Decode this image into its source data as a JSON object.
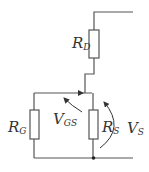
{
  "diagram": {
    "type": "circuit",
    "line_color": "#555555",
    "components": [
      {
        "id": "RD",
        "label_main": "R",
        "label_sub": "D",
        "kind": "resistor"
      },
      {
        "id": "RG",
        "label_main": "R",
        "label_sub": "G",
        "kind": "resistor"
      },
      {
        "id": "RS",
        "label_main": "R",
        "label_sub": "S",
        "kind": "resistor"
      }
    ],
    "voltages": [
      {
        "id": "VGS",
        "label_main": "V",
        "label_sub": "GS"
      },
      {
        "id": "VS",
        "label_main": "V",
        "label_sub": "S"
      }
    ]
  }
}
